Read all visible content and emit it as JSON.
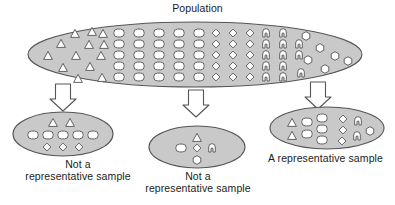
{
  "diagram": {
    "title": "Population",
    "palette": {
      "ellipse_fill": "#c9c9c9",
      "ellipse_stroke": "#555555",
      "glyph_fill": "#ffffff",
      "glyph_stroke": "#555555",
      "arrow_fill": "#ffffff",
      "arrow_stroke": "#555555",
      "text_color": "#1b1b1b",
      "background": "#ffffff"
    },
    "population": {
      "name": "population-ellipse",
      "label": "Population",
      "groups": [
        {
          "shape": "triangle",
          "name": "triangle-group",
          "count": 13
        },
        {
          "shape": "oval",
          "name": "oval-group",
          "count": 25
        },
        {
          "shape": "diamond",
          "name": "diamond-group",
          "count": 15
        },
        {
          "shape": "arc",
          "name": "arc-group",
          "count": 13
        },
        {
          "shape": "hexagon",
          "name": "hexagon-group",
          "count": 6
        }
      ]
    },
    "arrows": [
      {
        "name": "arrow-to-left-sample"
      },
      {
        "name": "arrow-to-middle-sample"
      },
      {
        "name": "arrow-to-right-sample"
      }
    ],
    "samples": [
      {
        "name": "left-sample",
        "caption": "Not a\nrepresentative sample",
        "contents": [
          {
            "shape": "triangle",
            "count": 2
          },
          {
            "shape": "oval",
            "count": 5
          },
          {
            "shape": "diamond",
            "count": 3
          }
        ]
      },
      {
        "name": "middle-sample",
        "caption": "Not a\nrepresentative sample",
        "contents": [
          {
            "shape": "triangle",
            "count": 1
          },
          {
            "shape": "oval",
            "count": 1
          },
          {
            "shape": "diamond",
            "count": 1
          },
          {
            "shape": "arc",
            "count": 1
          },
          {
            "shape": "hexagon",
            "count": 1
          }
        ]
      },
      {
        "name": "right-sample",
        "caption": "A representative sample",
        "contents": [
          {
            "shape": "triangle",
            "count": 2
          },
          {
            "shape": "oval",
            "count": 5
          },
          {
            "shape": "diamond",
            "count": 3
          },
          {
            "shape": "arc",
            "count": 2
          },
          {
            "shape": "hexagon",
            "count": 1
          }
        ]
      }
    ]
  }
}
